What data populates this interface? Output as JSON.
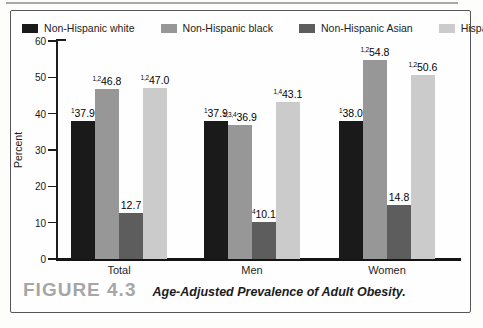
{
  "figure": {
    "number": "FIGURE 4.3",
    "caption": "Age-Adjusted Prevalence of Adult Obesity."
  },
  "chart_data": {
    "type": "bar",
    "title": "",
    "xlabel": "",
    "ylabel": "Percent",
    "ylim": [
      0,
      60
    ],
    "yticks": [
      0,
      10,
      20,
      30,
      40,
      50,
      60
    ],
    "grid": false,
    "legend_position": "top",
    "categories": [
      "Total",
      "Men",
      "Women"
    ],
    "series": [
      {
        "name": "Non-Hispanic white",
        "color": "#1a1a1a",
        "values": [
          37.9,
          37.9,
          38.0
        ],
        "superscripts": [
          "1",
          "1",
          "1"
        ]
      },
      {
        "name": "Non-Hispanic black",
        "color": "#979797",
        "values": [
          46.8,
          36.9,
          54.8
        ],
        "superscripts": [
          "1,2",
          "1,3,4",
          "1,2"
        ]
      },
      {
        "name": "Non-Hispanic Asian",
        "color": "#5d5d5d",
        "values": [
          12.7,
          10.1,
          14.8
        ],
        "superscripts": [
          "",
          "4",
          ""
        ]
      },
      {
        "name": "Hispanic",
        "color": "#cbcbcb",
        "values": [
          47.0,
          43.1,
          50.6
        ],
        "superscripts": [
          "1,2",
          "1,4",
          "1,2"
        ]
      }
    ]
  }
}
